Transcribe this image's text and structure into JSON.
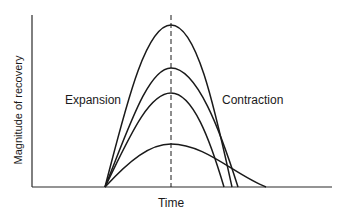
{
  "figure": {
    "ylabel": "Magnitude of recovery",
    "xlabel": "Time",
    "labels": {
      "expansion": "Expansion",
      "contraction": "Contraction"
    },
    "colors": {
      "line": "#1a1a1a",
      "axis": "#2a2a2a",
      "background": "#ffffff"
    },
    "curves": [
      {
        "name": "curve-1",
        "peak_y": 25,
        "end_x": 232
      },
      {
        "name": "curve-2",
        "peak_y": 68,
        "end_x": 238
      },
      {
        "name": "curve-3",
        "peak_y": 93,
        "end_x": 224
      },
      {
        "name": "curve-4",
        "peak_y": 144,
        "end_x": 266
      }
    ]
  }
}
